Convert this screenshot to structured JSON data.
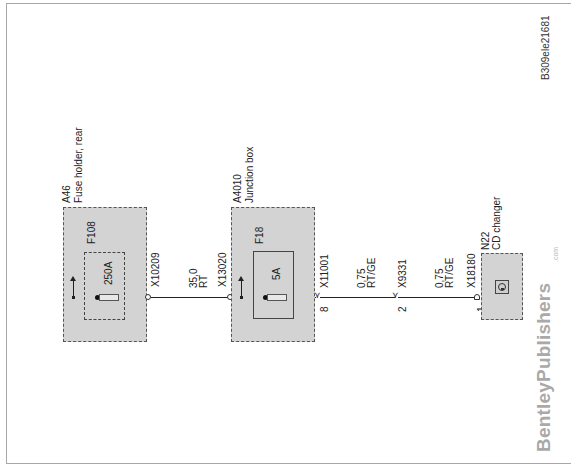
{
  "figure_id": "B309ele21681",
  "brand": {
    "name": "BentleyPublishers",
    "suffix": ".com"
  },
  "components": [
    {
      "ref": "A46",
      "name": "Fuse holder, rear",
      "fuse": {
        "ref": "F108",
        "rating": "250A",
        "enclosure": "dashed"
      }
    },
    {
      "ref": "A4010",
      "name": "Junction box",
      "fuse": {
        "ref": "F18",
        "rating": "5A",
        "enclosure": "solid"
      }
    },
    {
      "ref": "N22",
      "name": "CD changer",
      "icon": "cd-changer-icon"
    }
  ],
  "connectors": [
    {
      "ref": "X10209",
      "pin": ""
    },
    {
      "ref": "X13020",
      "pin": ""
    },
    {
      "ref": "X11001",
      "pin": "8"
    },
    {
      "ref": "X9331",
      "pin": "2"
    },
    {
      "ref": "X18180",
      "pin": "1"
    }
  ],
  "wires": [
    {
      "gauge": "35,0",
      "color": "RT"
    },
    {
      "gauge": "0,75",
      "color": "RT/GE"
    },
    {
      "gauge": "0,75",
      "color": "RT/GE"
    }
  ],
  "colors": {
    "component_fill": "#d3d3d3",
    "wire": "#222222",
    "brand": "#a9a9a9"
  }
}
